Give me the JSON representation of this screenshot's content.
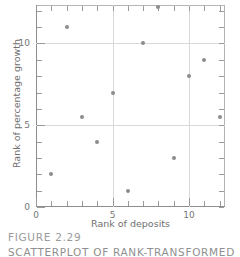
{
  "caption": {
    "title": "FIGURE  2.29",
    "subtitle": "SCATTERPLOT  OF  RANK-TRANSFORMED"
  },
  "chart_data": {
    "type": "scatter",
    "title": "",
    "xlabel": "Rank of deposits",
    "ylabel": "Rank of percentage growth",
    "xlim": [
      0,
      12.35
    ],
    "ylim": [
      0,
      12.35
    ],
    "xticks": [
      0,
      5,
      10
    ],
    "yticks": [
      0,
      5,
      10
    ],
    "xtick_labels": [
      "0",
      "5",
      "10"
    ],
    "ytick_labels": [
      "0",
      "5",
      "10"
    ],
    "minor_ticks": [
      1,
      2,
      3,
      4,
      6,
      7,
      8,
      9,
      11,
      12
    ],
    "grid": true,
    "gridlines_x": [
      5,
      10
    ],
    "gridlines_y": [
      5,
      10
    ],
    "legend": "none",
    "marker_color": "#8c8c8c",
    "grid_color": "#d9d9d9",
    "axis_color": "#8d8d8d",
    "points": [
      {
        "x": 1,
        "y": 2.0
      },
      {
        "x": 2,
        "y": 11.0
      },
      {
        "x": 3,
        "y": 5.5
      },
      {
        "x": 4,
        "y": 4.0
      },
      {
        "x": 5,
        "y": 7.0
      },
      {
        "x": 6,
        "y": 1.0
      },
      {
        "x": 7,
        "y": 10.0
      },
      {
        "x": 8,
        "y": 12.2
      },
      {
        "x": 9,
        "y": 3.0
      },
      {
        "x": 10,
        "y": 8.0
      },
      {
        "x": 11,
        "y": 9.0
      },
      {
        "x": 12,
        "y": 5.5
      }
    ]
  }
}
